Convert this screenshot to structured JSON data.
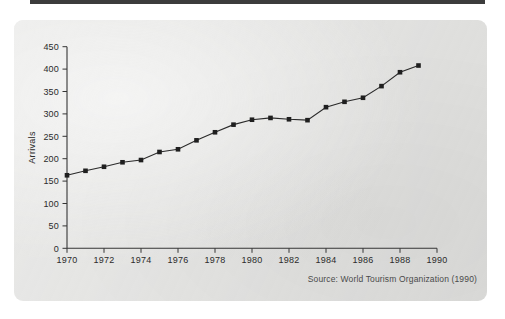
{
  "figure": {
    "source_note": "Source: World Tourism Organization (1990)"
  },
  "chart_data": {
    "type": "line",
    "title": "",
    "xlabel": "",
    "ylabel": "Arrivals",
    "xlim": [
      1970,
      1990
    ],
    "ylim": [
      0,
      450
    ],
    "grid": false,
    "legend": "none",
    "marker": "square",
    "line_color": "#2a2a2a",
    "marker_color": "#1f1f1f",
    "x_tick_labels": [
      "1970",
      "1972",
      "1974",
      "1976",
      "1978",
      "1980",
      "1982",
      "1984",
      "1986",
      "1988",
      "1990"
    ],
    "x_tick_values": [
      1970,
      1972,
      1974,
      1976,
      1978,
      1980,
      1982,
      1984,
      1986,
      1988,
      1990
    ],
    "y_tick_labels": [
      "0",
      "50",
      "100",
      "150",
      "200",
      "250",
      "300",
      "350",
      "400",
      "450"
    ],
    "y_tick_values": [
      0,
      50,
      100,
      150,
      200,
      250,
      300,
      350,
      400,
      450
    ],
    "x": [
      1970,
      1971,
      1972,
      1973,
      1974,
      1975,
      1976,
      1977,
      1978,
      1979,
      1980,
      1981,
      1982,
      1983,
      1984,
      1985,
      1986,
      1987,
      1988,
      1989
    ],
    "values": [
      163,
      173,
      182,
      192,
      197,
      215,
      221,
      241,
      259,
      276,
      287,
      291,
      288,
      286,
      315,
      327,
      336,
      362,
      393,
      408
    ],
    "series": [
      {
        "name": "Arrivals",
        "values": [
          163,
          173,
          182,
          192,
          197,
          215,
          221,
          241,
          259,
          276,
          287,
          291,
          288,
          286,
          315,
          327,
          336,
          362,
          393,
          408
        ]
      }
    ]
  }
}
